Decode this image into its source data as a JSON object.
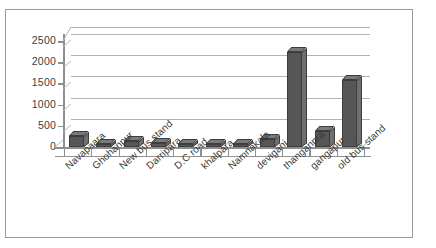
{
  "chart_data": {
    "type": "bar",
    "title": "",
    "subtitle": "",
    "xlabel": "",
    "ylabel": "",
    "ylim": [
      0,
      2500
    ],
    "yticks": [
      0,
      500,
      1000,
      1500,
      2000,
      2500
    ],
    "ytick_labels": [
      "0",
      "500",
      "1000",
      "1500",
      "2000",
      "2500"
    ],
    "grid": true,
    "legend": false,
    "legend_position": "none",
    "style": "3d-column",
    "bar_color": "#565656",
    "gridline_color": "#b9b9b9",
    "axis_color": "#8f8f8f",
    "categories": [
      "Navapaara",
      "Ghohanpur",
      "New bus stand",
      "Darripara",
      "D.C road",
      "khalpara",
      "Namnakala",
      "deviganj",
      "thanganpra",
      "gangapur",
      "old bus stand"
    ],
    "values": [
      250,
      80,
      150,
      90,
      80,
      80,
      70,
      200,
      2250,
      370,
      1580
    ]
  }
}
